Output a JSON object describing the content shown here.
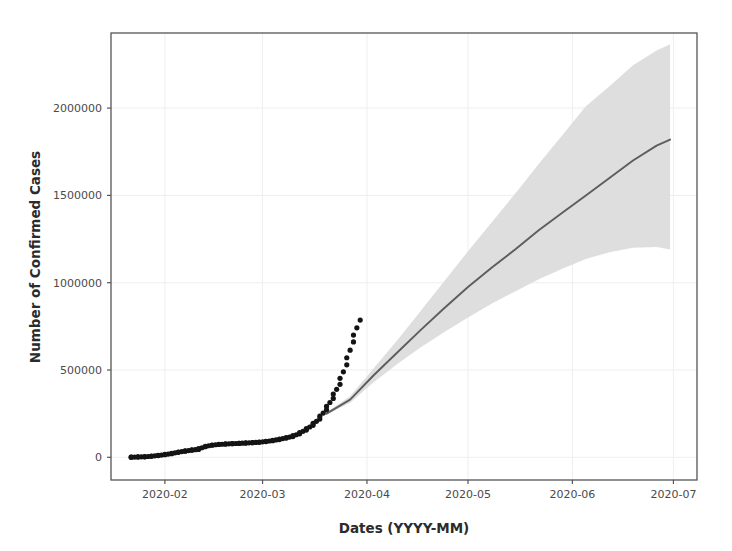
{
  "chart_data": {
    "type": "line",
    "title": "",
    "xlabel": "Dates (YYYY-MM)",
    "ylabel": "Number of Confirmed Cases",
    "grid": true,
    "legend_position": "none",
    "x_type": "date",
    "x_tick_labels": [
      "2020-02",
      "2020-03",
      "2020-04",
      "2020-05",
      "2020-06",
      "2020-07"
    ],
    "x_tick_values": [
      "2020-02-01",
      "2020-03-01",
      "2020-04-01",
      "2020-05-01",
      "2020-06-01",
      "2020-07-01"
    ],
    "xlim": [
      "2020-01-16",
      "2020-07-08"
    ],
    "y_tick_labels": [
      "0",
      "500000",
      "1000000",
      "1500000",
      "2000000"
    ],
    "y_tick_values": [
      0,
      500000,
      1000000,
      1500000,
      2000000
    ],
    "ylim": [
      -130000,
      2430000
    ],
    "colors": {
      "observed_points": "#141414",
      "forecast_line": "#5d5d5d",
      "confidence_band": "#dcdcdc",
      "axis": "#555555",
      "grid": "#f0eeee",
      "text": "#3a3a3a"
    },
    "series": [
      {
        "name": "Observed confirmed cases",
        "type": "scatter",
        "marker": "circle",
        "color": "#141414",
        "x": [
          "2020-01-22",
          "2020-01-24",
          "2020-01-26",
          "2020-01-28",
          "2020-01-30",
          "2020-02-01",
          "2020-02-03",
          "2020-02-05",
          "2020-02-07",
          "2020-02-09",
          "2020-02-11",
          "2020-02-13",
          "2020-02-15",
          "2020-02-17",
          "2020-02-19",
          "2020-02-21",
          "2020-02-23",
          "2020-02-25",
          "2020-02-27",
          "2020-02-29",
          "2020-03-02",
          "2020-03-04",
          "2020-03-06",
          "2020-03-08",
          "2020-03-10",
          "2020-03-12",
          "2020-03-14",
          "2020-03-16",
          "2020-03-18",
          "2020-03-20",
          "2020-03-22",
          "2020-03-24",
          "2020-03-26",
          "2020-03-28",
          "2020-03-30"
        ],
        "y": [
          555,
          1950,
          2927,
          5578,
          9927,
          14557,
          20630,
          28276,
          34886,
          40554,
          45178,
          60370,
          69030,
          73336,
          75641,
          77794,
          79561,
          81397,
          83652,
          86011,
          90306,
          95124,
          101800,
          109825,
          118592,
          134580,
          156096,
          183012,
          218823,
          272166,
          337021,
          418040,
          529591,
          660706,
          785807
        ]
      },
      {
        "name": "Forecast (mean)",
        "type": "line",
        "color": "#5d5d5d",
        "x": [
          "2020-03-20",
          "2020-03-27",
          "2020-04-03",
          "2020-04-10",
          "2020-04-17",
          "2020-04-24",
          "2020-05-01",
          "2020-05-08",
          "2020-05-15",
          "2020-05-22",
          "2020-05-29",
          "2020-06-05",
          "2020-06-12",
          "2020-06-19",
          "2020-06-26",
          "2020-06-30"
        ],
        "y": [
          250000,
          330000,
          470000,
          600000,
          730000,
          855000,
          975000,
          1085000,
          1190000,
          1300000,
          1400000,
          1500000,
          1600000,
          1700000,
          1785000,
          1820000
        ]
      },
      {
        "name": "Confidence interval (upper)",
        "type": "line",
        "color": "#dcdcdc",
        "x": [
          "2020-03-20",
          "2020-03-27",
          "2020-04-03",
          "2020-04-10",
          "2020-04-17",
          "2020-04-24",
          "2020-05-01",
          "2020-05-08",
          "2020-05-15",
          "2020-05-22",
          "2020-05-29",
          "2020-06-05",
          "2020-06-12",
          "2020-06-19",
          "2020-06-26",
          "2020-06-30"
        ],
        "y": [
          258000,
          350000,
          510000,
          670000,
          840000,
          1010000,
          1180000,
          1345000,
          1510000,
          1680000,
          1845000,
          2010000,
          2125000,
          2245000,
          2330000,
          2365000
        ]
      },
      {
        "name": "Confidence interval (lower)",
        "type": "line",
        "color": "#dcdcdc",
        "x": [
          "2020-03-20",
          "2020-03-27",
          "2020-04-03",
          "2020-04-10",
          "2020-04-17",
          "2020-04-24",
          "2020-05-01",
          "2020-05-08",
          "2020-05-15",
          "2020-05-22",
          "2020-05-29",
          "2020-06-05",
          "2020-06-12",
          "2020-06-19",
          "2020-06-26",
          "2020-06-30"
        ],
        "y": [
          243000,
          312000,
          430000,
          535000,
          630000,
          718000,
          800000,
          880000,
          950000,
          1020000,
          1080000,
          1135000,
          1175000,
          1200000,
          1205000,
          1190000
        ]
      }
    ]
  }
}
